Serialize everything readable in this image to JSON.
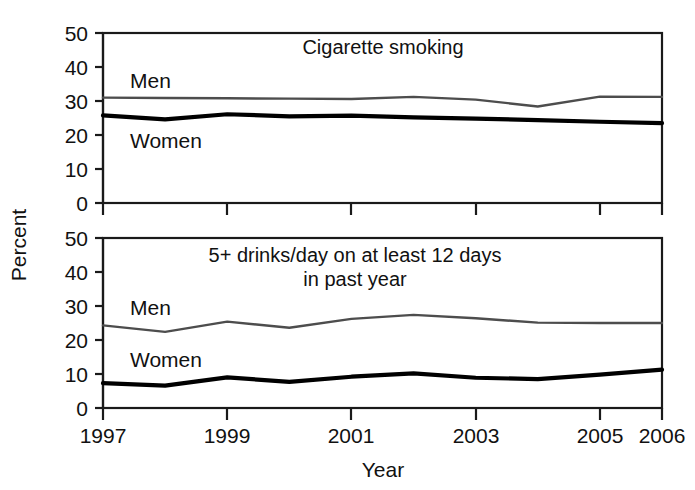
{
  "chart_data": {
    "type": "line",
    "title": "",
    "xlabel": "Year",
    "ylabel": "Percent",
    "x": [
      1997,
      1998,
      1999,
      2000,
      2001,
      2002,
      2003,
      2004,
      2005,
      2006
    ],
    "xlim": [
      1997,
      2006
    ],
    "ylim": [
      0,
      50
    ],
    "yticks": [
      0,
      10,
      20,
      30,
      40,
      50
    ],
    "xticks": [
      1997,
      1999,
      2001,
      2003,
      2005,
      2006
    ],
    "xtick_labels": [
      "1997",
      "1999",
      "2001",
      "2003",
      "2005",
      "2006"
    ],
    "ytick_labels": [
      "0",
      "10",
      "20",
      "30",
      "40",
      "50"
    ],
    "grid": false,
    "legend_position": "inline-labels",
    "panels": [
      {
        "id": "cigarette-smoking",
        "title": "Cigarette smoking",
        "title_lines": [
          "Cigarette smoking"
        ],
        "series": [
          {
            "name": "Men",
            "label": "Men",
            "color": "#4d4d4d",
            "values": [
              31.0,
              30.9,
              30.8,
              30.7,
              30.6,
              31.2,
              30.4,
              28.4,
              31.3,
              31.2
            ]
          },
          {
            "name": "Women",
            "label": "Women",
            "color": "#000000",
            "values": [
              25.8,
              24.6,
              26.1,
              25.5,
              25.7,
              25.2,
              24.8,
              24.4,
              23.9,
              23.5
            ]
          }
        ]
      },
      {
        "id": "binge-drinking",
        "title": "5+ drinks/day on at least 12 days in past year",
        "title_lines": [
          "5+ drinks/day on at least 12 days",
          "in past year"
        ],
        "series": [
          {
            "name": "Men",
            "label": "Men",
            "color": "#4d4d4d",
            "values": [
              24.3,
              22.4,
              25.4,
              23.6,
              26.2,
              27.4,
              26.4,
              25.1,
              25.0,
              25.0
            ]
          },
          {
            "name": "Women",
            "label": "Women",
            "color": "#000000",
            "values": [
              7.3,
              6.6,
              9.0,
              7.7,
              9.2,
              10.2,
              8.9,
              8.5,
              9.8,
              11.3
            ]
          }
        ]
      }
    ]
  },
  "axes": {
    "y_title": "Percent",
    "x_title": "Year"
  }
}
